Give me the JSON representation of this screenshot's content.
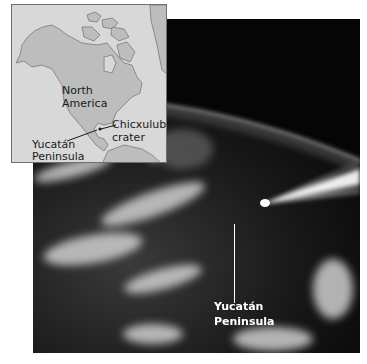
{
  "photo": {
    "label_line1": "Yucatán",
    "label_line2": "Peninsula"
  },
  "inset_map": {
    "continent_line1": "North",
    "continent_line2": "America",
    "crater_line1": "Chicxulub",
    "crater_line2": "crater",
    "peninsula_line1": "Yucatán",
    "peninsula_line2": "Peninsula"
  },
  "colors": {
    "ocean": "#d8d8d8",
    "land": "#bdbdbd",
    "space": "#050505"
  }
}
